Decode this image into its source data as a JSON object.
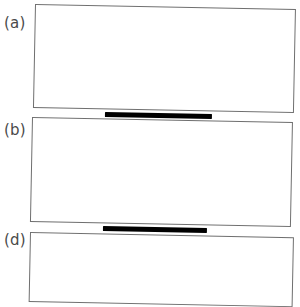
{
  "figure": {
    "background_color": "#ffffff",
    "frame_color": "#6f6f6f",
    "bar_color": "#000000",
    "label_color": "#4a4a4a",
    "panels": [
      {
        "id": "a",
        "label": "(a)",
        "frame": {
          "x": 35,
          "y": 4,
          "width": 261,
          "height": 104,
          "rotation_deg": 1.12
        },
        "label_position": {
          "x": 4,
          "y": 15
        }
      },
      {
        "id": "b",
        "label": "(b)",
        "frame": {
          "x": 32,
          "y": 117,
          "width": 261,
          "height": 105,
          "rotation_deg": 1.12
        },
        "label_position": {
          "x": 4,
          "y": 122
        }
      },
      {
        "id": "d",
        "label": "(d)",
        "frame": {
          "x": 30,
          "y": 232,
          "width": 264,
          "height": 70,
          "rotation_deg": 1.12
        },
        "label_position": {
          "x": 4,
          "y": 232
        }
      }
    ],
    "separator_bars": [
      {
        "id": "bar-ab",
        "between": "a-b",
        "x": 105,
        "y": 112,
        "width": 107,
        "height": 5,
        "rotation_deg": 1.12,
        "color": "#000000"
      },
      {
        "id": "bar-bd",
        "between": "b-d",
        "x": 103,
        "y": 226,
        "width": 104,
        "height": 5,
        "rotation_deg": 1.12,
        "color": "#000000"
      }
    ]
  }
}
